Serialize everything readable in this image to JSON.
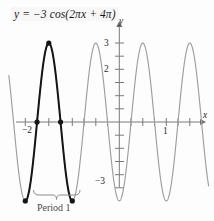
{
  "figure": {
    "equation": "y = −3 cos(2πx + 4π)",
    "period_annotation": "Period 1",
    "axis_labels": {
      "x": "x",
      "y": "y"
    }
  },
  "chart_data": {
    "type": "line",
    "title": "y = −3 cos(2πx + 4π)",
    "xlabel": "x",
    "ylabel": "y",
    "function": "y = -3*cos(2*pi*x + 4*pi)",
    "amplitude": 3,
    "period": 1,
    "phase_shift": -2,
    "vertical_reflection": true,
    "xlim": [
      -2.35,
      1.9
    ],
    "ylim": [
      -3.45,
      3.45
    ],
    "grid": false,
    "legend": false,
    "x_ticks": [
      -2,
      -1.75,
      -1.5,
      -1.25,
      -1,
      -0.75,
      -0.5,
      -0.25,
      0.25,
      0.5,
      0.75,
      1,
      1.25,
      1.5,
      1.75
    ],
    "x_tick_labels": [
      {
        "value": -2,
        "label": "−2"
      },
      {
        "value": 1,
        "label": "1"
      }
    ],
    "y_ticks": [
      -3,
      -2.5,
      -2,
      -1.5,
      -1,
      -0.5,
      0.5,
      1,
      1.5,
      2,
      2.5,
      3
    ],
    "y_tick_labels": [
      {
        "value": 3,
        "label": "3"
      },
      {
        "value": 2,
        "label": "2"
      },
      {
        "value": -3,
        "label": "−3"
      }
    ],
    "series": [
      {
        "name": "full-curve",
        "color": "#9a9a9a",
        "style": "solid",
        "x_range": [
          -2.35,
          1.9
        ]
      },
      {
        "name": "highlighted-period",
        "color": "#1a1a1a",
        "style": "solid-bold",
        "x_range": [
          -2,
          -1
        ],
        "description": "one full period emphasized"
      }
    ],
    "marked_points": [
      {
        "x": -2,
        "y": -3,
        "kind": "minimum"
      },
      {
        "x": -1.75,
        "y": 0,
        "kind": "zero-crossing"
      },
      {
        "x": -1.5,
        "y": 3,
        "kind": "maximum"
      },
      {
        "x": -1.25,
        "y": 0,
        "kind": "zero-crossing"
      },
      {
        "x": -1,
        "y": -3,
        "kind": "minimum"
      }
    ],
    "annotations": [
      {
        "text": "Period 1",
        "x_start": -2,
        "x_end": -1,
        "y": -3.35,
        "type": "brace"
      }
    ]
  }
}
